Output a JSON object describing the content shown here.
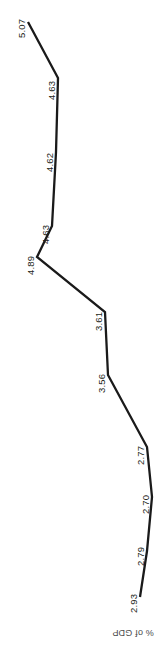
{
  "chart_data": {
    "type": "line",
    "title": "",
    "subtitle": "",
    "xlabel": "",
    "ylabel": "% of GDP",
    "orientation": "rotated-90-clockwise",
    "grid": false,
    "legend": null,
    "categories": [
      "1",
      "2",
      "3",
      "4",
      "5",
      "6",
      "7",
      "8",
      "9",
      "10",
      "11"
    ],
    "values": [
      5.07,
      4.63,
      4.62,
      4.63,
      4.89,
      3.61,
      3.56,
      2.77,
      2.7,
      2.79,
      2.93
    ],
    "point_labels": [
      "5.07",
      "4.63",
      "4.62",
      "4.63",
      "4.89",
      "3.61",
      "3.56",
      "2.77",
      "2.70",
      "2.79",
      "2.93"
    ],
    "ylim": [
      2.0,
      5.5
    ],
    "series": [
      {
        "name": "% of GDP",
        "values": [
          5.07,
          4.63,
          4.62,
          4.63,
          4.89,
          3.61,
          3.56,
          2.77,
          2.7,
          2.79,
          2.93
        ],
        "color": "#1a1a1a"
      }
    ],
    "line_color": "#1a1a1a",
    "line_width": 2.3,
    "pixel_points": [
      [
        28,
        22
      ],
      [
        58,
        78
      ],
      [
        56,
        152
      ],
      [
        52,
        226
      ],
      [
        37,
        257
      ],
      [
        105,
        312
      ],
      [
        108,
        375
      ],
      [
        147,
        447
      ],
      [
        152,
        497
      ],
      [
        147,
        551
      ],
      [
        140,
        597
      ]
    ],
    "label_positions": [
      {
        "text": "5.07",
        "x": 16,
        "y": 38
      },
      {
        "text": "4.63",
        "x": 46,
        "y": 100
      },
      {
        "text": "4.62",
        "x": 44,
        "y": 172
      },
      {
        "text": "4.63",
        "x": 40,
        "y": 244
      },
      {
        "text": "4.89",
        "x": 25,
        "y": 275
      },
      {
        "text": "3.61",
        "x": 93,
        "y": 331
      },
      {
        "text": "3.56",
        "x": 96,
        "y": 393
      },
      {
        "text": "2.77",
        "x": 135,
        "y": 465
      },
      {
        "text": "2.70",
        "x": 140,
        "y": 514
      },
      {
        "text": "2.79",
        "x": 135,
        "y": 566
      },
      {
        "text": "2.93",
        "x": 128,
        "y": 613
      }
    ]
  },
  "axis": {
    "label": "% of GDP"
  }
}
